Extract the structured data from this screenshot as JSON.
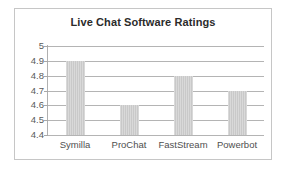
{
  "chart_data": {
    "type": "bar",
    "title": "Live Chat Software Ratings",
    "categories": [
      "Symilla",
      "ProChat",
      "FastStream",
      "Powerbot"
    ],
    "values": [
      4.9,
      4.6,
      4.8,
      4.7
    ],
    "xlabel": "",
    "ylabel": "",
    "ylim": [
      4.4,
      5.0
    ],
    "ytick_labels": [
      "5",
      "4.9",
      "4.8",
      "4.7",
      "4.6",
      "4.5",
      "4.4"
    ],
    "ytick_values": [
      5.0,
      4.9,
      4.8,
      4.7,
      4.6,
      4.5,
      4.4
    ],
    "grid": true,
    "legend": false,
    "bar_color": "#c9c9c9",
    "gridline_color": "#b4b4b4",
    "title_color": "#2b2b2b",
    "tick_label_color": "#5a5a5a",
    "border_color": "#c6c6c6",
    "background_color": "#ffffff"
  }
}
